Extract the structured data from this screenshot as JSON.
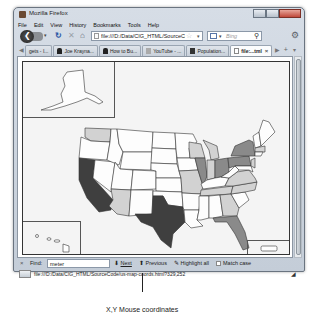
{
  "window": {
    "title": "Mozilla Firefox",
    "controls": [
      "minimize",
      "maximize",
      "close"
    ]
  },
  "menubar": {
    "items": [
      "File",
      "Edit",
      "View",
      "History",
      "Bookmarks",
      "Tools",
      "Help"
    ]
  },
  "navbar": {
    "url": "file:///D:/Data/CIG_HTML/SourceCo",
    "search_placeholder": "Bing"
  },
  "tabs": [
    {
      "label": "gets - I...",
      "icon": "page-icon",
      "active": false
    },
    {
      "label": "Joe Krayna...",
      "icon": "person-icon",
      "active": false
    },
    {
      "label": "How to Bu...",
      "icon": "person-icon",
      "active": false
    },
    {
      "label": "YouTube - ...",
      "icon": "youtube-icon",
      "active": false
    },
    {
      "label": "Population...",
      "icon": "population-icon",
      "active": false
    },
    {
      "label": "file:...tml",
      "icon": "page-icon",
      "active": true
    }
  ],
  "map": {
    "title": "US map with state choropleth",
    "colors": {
      "dark": "#3f3f3f",
      "medium": "#8a8a8a",
      "light": "#d2d2d2",
      "white": "#fdfdfd",
      "background": "#f4f4f4"
    },
    "dark_states": [
      "California",
      "Texas"
    ],
    "medium_states": [
      "Illinois",
      "Ohio",
      "New York",
      "Pennsylvania",
      "Florida"
    ],
    "light_states": [
      "Washington",
      "Arizona",
      "Missouri",
      "Wisconsin",
      "Michigan",
      "Indiana",
      "Georgia",
      "Tennessee",
      "North Carolina",
      "Virginia",
      "New Jersey",
      "Massachusetts"
    ],
    "insets": [
      "Alaska",
      "Hawaii",
      "Puerto Rico"
    ]
  },
  "findbar": {
    "close": "×",
    "label": "Find:",
    "value": "meter",
    "next": "Next",
    "previous": "Previous",
    "highlight": "Highlight all",
    "match_case": "Match case"
  },
  "statusbar": {
    "url": "file:///D:/Data/CIG_HTML/SourceCode/us-map-coords.html?329,252"
  },
  "caption": "X,Y Mouse coordinates"
}
